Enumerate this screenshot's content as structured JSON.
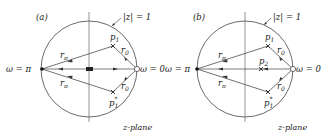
{
  "panels": [
    {
      "id": "a",
      "label": "(a)",
      "unit_circle_label": "|z| = 1",
      "plane_label": "z-plane",
      "omega_pi_label": "ω = π",
      "omega_zero_label": "ω = 0",
      "vector_pi_label": "r",
      "vector_pi_sub": "π",
      "vector_zero_label": "r",
      "vector_zero_sub": "0",
      "pole1_label": "p",
      "pole1_sub": "1",
      "pole1_conj_label": "p",
      "pole1_conj_sub": "1",
      "pole1_conj_sup": "*"
    },
    {
      "id": "b",
      "label": "(b)",
      "unit_circle_label": "|z| = 1",
      "plane_label": "z-plane",
      "omega_pi_label": "ω = π",
      "omega_zero_label": "ω = 0",
      "vector_pi_label": "r",
      "vector_pi_sub": "π",
      "vector_zero_label": "r",
      "vector_zero_sub": "0",
      "pole1_label": "p",
      "pole1_sub": "1",
      "pole1_conj_label": "p",
      "pole1_conj_sub": "1",
      "pole1_conj_sup": "*",
      "pole2_label": "p",
      "pole2_sub": "2"
    }
  ],
  "colors": {
    "stroke": "#333333",
    "text": "#222222",
    "background": "#ffffff"
  }
}
